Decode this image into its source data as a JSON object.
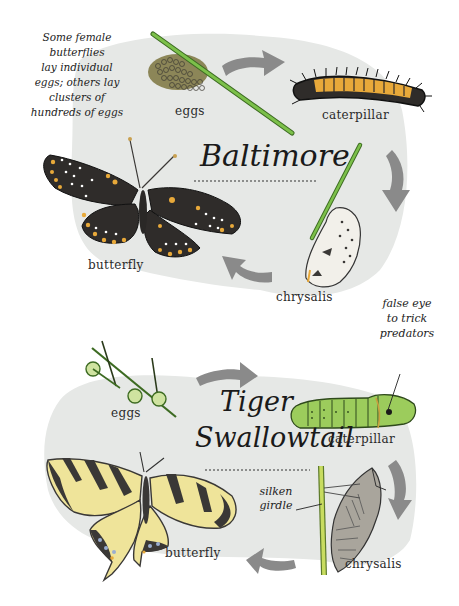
{
  "colors": {
    "background": "#ffffff",
    "blob": "#e6e8e6",
    "arrow": "#8a8a8a",
    "stem_green": "#7cc04a",
    "stem_outline": "#3d6b22",
    "egg_green": "#cfe3a0",
    "caterpillar_green": "#9ccc5c",
    "baltimore_orange": "#e8a93a",
    "baltimore_black": "#2f2c2a",
    "swallowtail_yellow": "#efe49a",
    "swallowtail_black": "#3a3836",
    "swallowtail_blue": "#9aaed0",
    "chrysalis_gray": "#a9a59c"
  },
  "baltimore": {
    "title": "Baltimore",
    "note": [
      "Some female",
      "butterflies",
      "lay individual",
      "eggs; others lay",
      "clusters of",
      "hundreds of eggs"
    ],
    "stages": {
      "eggs": "eggs",
      "caterpillar": "caterpillar",
      "chrysalis": "chrysalis",
      "butterfly": "butterfly"
    }
  },
  "tiger_swallowtail": {
    "title_line1": "Tiger",
    "title_line2": "Swallowtail",
    "note_false_eye": [
      "false eye",
      "to trick",
      "predators"
    ],
    "note_girdle": [
      "silken",
      "girdle"
    ],
    "stages": {
      "eggs": "eggs",
      "caterpillar": "caterpillar",
      "chrysalis": "chrysalis",
      "butterfly": "butterfly"
    }
  }
}
